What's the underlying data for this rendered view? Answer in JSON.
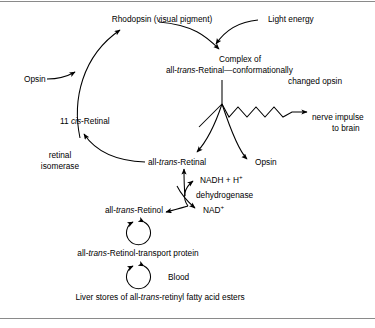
{
  "figure": {
    "line_color": "#000000",
    "background": "#ffffff",
    "rule_color": "#8a8a8a"
  },
  "labels": {
    "rhodopsin": "Rhodopsin (visual pigment)",
    "light_energy": "Light energy",
    "complex_line1": "Complex of",
    "complex_line2_a": "all-",
    "complex_line2_b": "trans",
    "complex_line2_c": "-Retinal—conformationally",
    "complex_line3": "changed opsin",
    "opsin_left": "Opsin",
    "opsin_right": "Opsin",
    "cis_retinal_a": "11 ",
    "cis_retinal_b": "cis",
    "cis_retinal_c": "-Retinal",
    "nerve_line1": "nerve impulse",
    "nerve_line2": "to brain",
    "isomerase_line1": "retinal",
    "isomerase_line2": "isomerase",
    "all_trans_retinal_a": "all-",
    "all_trans_retinal_b": "trans",
    "all_trans_retinal_c": "-Retinal",
    "nadh_a": "NADH + H",
    "nadh_sup": "+",
    "dehydrogenase": "dehydrogenase",
    "nad_a": "NAD",
    "nad_sup": "+",
    "all_trans_retinol_a": "all-",
    "all_trans_retinol_b": "trans",
    "all_trans_retinol_c": "-Retinol",
    "transport_a": "all-",
    "transport_b": "trans",
    "transport_c": "-Retinol-transport protein",
    "blood": "Blood",
    "liver_a": "Liver stores of all-",
    "liver_b": "trans",
    "liver_c": "-retinyl fatty acid esters"
  }
}
